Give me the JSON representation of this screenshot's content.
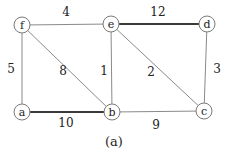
{
  "diagram": {
    "type": "weighted-undirected-graph",
    "caption": "(a)",
    "nodes": [
      {
        "id": "f",
        "label": "f",
        "x": 22,
        "y": 25
      },
      {
        "id": "e",
        "label": "e",
        "x": 111,
        "y": 24
      },
      {
        "id": "d",
        "label": "d",
        "x": 207,
        "y": 24
      },
      {
        "id": "a",
        "label": "a",
        "x": 22,
        "y": 112
      },
      {
        "id": "b",
        "label": "b",
        "x": 112,
        "y": 112
      },
      {
        "id": "c",
        "label": "c",
        "x": 204,
        "y": 111
      }
    ],
    "edges": [
      {
        "from": "f",
        "to": "e",
        "weight": "4",
        "bold": false,
        "lx": 66,
        "ly": 16
      },
      {
        "from": "e",
        "to": "d",
        "weight": "12",
        "bold": true,
        "lx": 158,
        "ly": 16
      },
      {
        "from": "f",
        "to": "a",
        "weight": "5",
        "bold": false,
        "lx": 11,
        "ly": 73
      },
      {
        "from": "f",
        "to": "b",
        "weight": "8",
        "bold": false,
        "lx": 63,
        "ly": 75
      },
      {
        "from": "e",
        "to": "b",
        "weight": "1",
        "bold": false,
        "lx": 104,
        "ly": 75
      },
      {
        "from": "e",
        "to": "c",
        "weight": "2",
        "bold": false,
        "lx": 151,
        "ly": 76
      },
      {
        "from": "d",
        "to": "c",
        "weight": "3",
        "bold": false,
        "lx": 217,
        "ly": 73
      },
      {
        "from": "a",
        "to": "b",
        "weight": "10",
        "bold": true,
        "lx": 66,
        "ly": 127
      },
      {
        "from": "b",
        "to": "c",
        "weight": "9",
        "bold": false,
        "lx": 156,
        "ly": 129
      }
    ],
    "node_radius": 8,
    "colors": {
      "edge": "#8a8a8a",
      "bold_edge": "#3a3a3a",
      "node_stroke": "#7a7a7a",
      "text": "#222222"
    }
  }
}
